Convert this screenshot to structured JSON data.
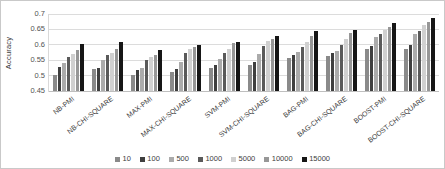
{
  "figure": {
    "background": "#ffffff",
    "border_color": "#c9c9c9",
    "gridline_color": "#dcdcdc",
    "axis_text_color": "#525252"
  },
  "chart_data": {
    "type": "bar",
    "title": "",
    "xlabel": "",
    "ylabel": "Accuracy",
    "ylim": [
      0.45,
      0.7
    ],
    "ytick_step": 0.05,
    "grid": true,
    "legend_position": "bottom",
    "categories": [
      "NB-PMI",
      "NB-CHI-SQUARE",
      "MAX-PMI",
      "MAX-CHI-SQUARE",
      "SVM-PMI",
      "SVM-CHI-SQUARE",
      "BAG-PMI",
      "BAG-CHI-SQUARE",
      "BOOST-PMI",
      "BOOST-CHI-SQUARE"
    ],
    "series": [
      {
        "name": "10",
        "color": "#8a8a8a",
        "values": [
          0.503,
          0.52,
          0.503,
          0.511,
          0.526,
          0.536,
          0.557,
          0.565,
          0.586,
          0.588
        ]
      },
      {
        "name": "100",
        "color": "#3f3f3f",
        "values": [
          0.527,
          0.526,
          0.517,
          0.52,
          0.533,
          0.545,
          0.568,
          0.572,
          0.597,
          0.6
        ]
      },
      {
        "name": "500",
        "color": "#ababab",
        "values": [
          0.54,
          0.55,
          0.524,
          0.545,
          0.553,
          0.571,
          0.576,
          0.581,
          0.625,
          0.634
        ]
      },
      {
        "name": "1000",
        "color": "#5a5a5a",
        "values": [
          0.562,
          0.567,
          0.552,
          0.572,
          0.573,
          0.596,
          0.594,
          0.601,
          0.636,
          0.645
        ]
      },
      {
        "name": "5000",
        "color": "#d0d0d0",
        "values": [
          0.57,
          0.572,
          0.56,
          0.586,
          0.588,
          0.612,
          0.608,
          0.62,
          0.647,
          0.664
        ]
      },
      {
        "name": "10000",
        "color": "#979797",
        "values": [
          0.582,
          0.588,
          0.568,
          0.594,
          0.605,
          0.618,
          0.63,
          0.638,
          0.658,
          0.675
        ]
      },
      {
        "name": "15000",
        "color": "#161616",
        "values": [
          0.603,
          0.61,
          0.582,
          0.598,
          0.61,
          0.627,
          0.645,
          0.649,
          0.672,
          0.686
        ]
      }
    ]
  }
}
